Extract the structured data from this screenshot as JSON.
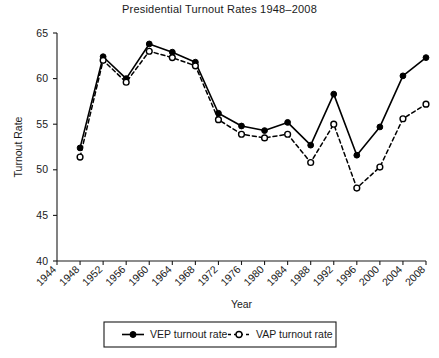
{
  "chart_data": {
    "type": "line",
    "title": "Presidential Turnout Rates 1948–2008",
    "xlabel": "Year",
    "ylabel": "Turnout Rate",
    "x": [
      1948,
      1952,
      1956,
      1960,
      1964,
      1968,
      1972,
      1976,
      1980,
      1984,
      1988,
      1992,
      1996,
      2000,
      2004,
      2008
    ],
    "xticks": [
      1944,
      1948,
      1952,
      1956,
      1960,
      1964,
      1968,
      1972,
      1976,
      1980,
      1984,
      1988,
      1992,
      1996,
      2000,
      2004,
      2008
    ],
    "yticks": [
      40,
      45,
      50,
      55,
      60,
      65
    ],
    "xlim": [
      1944,
      2008
    ],
    "ylim": [
      40,
      65
    ],
    "grid": false,
    "legend_position": "bottom",
    "series": [
      {
        "name": "VEP turnout rate",
        "marker": "filled-circle",
        "linestyle": "solid",
        "color": "#000000",
        "values": [
          52.4,
          62.4,
          60.0,
          63.8,
          62.9,
          61.8,
          56.2,
          54.8,
          54.3,
          55.2,
          52.7,
          58.3,
          51.6,
          54.7,
          60.3,
          62.3
        ]
      },
      {
        "name": "VAP turnout rate",
        "marker": "open-circle",
        "linestyle": "dashed",
        "color": "#000000",
        "values": [
          51.4,
          62.0,
          59.6,
          63.0,
          62.3,
          61.4,
          55.5,
          53.9,
          53.5,
          53.9,
          50.8,
          55.0,
          48.0,
          50.3,
          55.6,
          57.2
        ]
      }
    ]
  },
  "legend": {
    "items": [
      {
        "label": "VEP turnout rate",
        "marker": "filled-circle",
        "linestyle": "solid"
      },
      {
        "label": "VAP turnout rate",
        "marker": "open-circle",
        "linestyle": "dashed"
      }
    ]
  }
}
